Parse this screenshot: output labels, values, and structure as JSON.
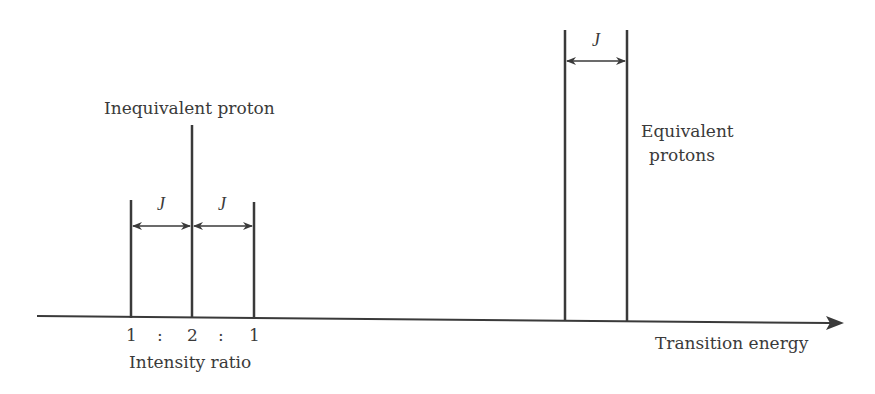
{
  "diagram": {
    "labels": {
      "inequivalent": "Inequivalent proton",
      "equivalent_line1": "Equivalent",
      "equivalent_line2": "protons",
      "axis": "Transition energy",
      "ratio_caption": "Intensity ratio",
      "ratio_1": "1",
      "ratio_sep1": ":",
      "ratio_2": "2",
      "ratio_sep2": ":",
      "ratio_3": "1",
      "coupling": "J"
    },
    "colors": {
      "line": "#3a3a3a",
      "text": "#3a3a3a"
    },
    "triplet_lines": [
      {
        "x": 131,
        "top": 200
      },
      {
        "x": 192,
        "top": 125
      },
      {
        "x": 254,
        "top": 202
      }
    ],
    "equivalent_lines": [
      {
        "x": 565,
        "top": 30
      },
      {
        "x": 627,
        "top": 30
      }
    ]
  }
}
